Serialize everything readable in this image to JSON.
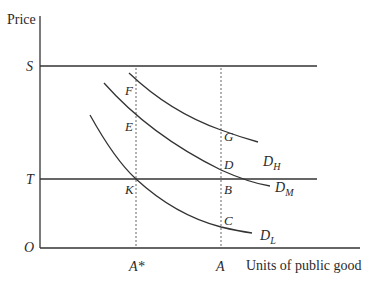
{
  "diagram": {
    "axes": {
      "y_label": "Price",
      "x_label": "Units of public good",
      "origin_label": "O",
      "y_ticks": [
        {
          "label": "S",
          "level": "upper price line"
        },
        {
          "label": "T",
          "level": "tax price line"
        }
      ],
      "x_ticks": [
        {
          "label": "A*",
          "position": "low demander optimum"
        },
        {
          "label": "A",
          "position": "chosen quantity"
        }
      ]
    },
    "horizontal_lines": [
      {
        "name": "S",
        "y_px": 66
      },
      {
        "name": "T",
        "y_px": 179
      }
    ],
    "curves": [
      {
        "name": "D_H",
        "base": "D",
        "sub": "H"
      },
      {
        "name": "D_M",
        "base": "D",
        "sub": "M"
      },
      {
        "name": "D_L",
        "base": "D",
        "sub": "L"
      }
    ],
    "points": [
      {
        "label": "F",
        "on": "D_H at A*"
      },
      {
        "label": "E",
        "on": "D_M at A*"
      },
      {
        "label": "K",
        "on": "D_L at A* / T line"
      },
      {
        "label": "G",
        "on": "D_H at A"
      },
      {
        "label": "D",
        "on": "D_M at A"
      },
      {
        "label": "B",
        "on": "T line at A"
      },
      {
        "label": "C",
        "on": "D_L at A"
      }
    ],
    "colors": {
      "line": "#333333",
      "background": "#ffffff"
    }
  }
}
